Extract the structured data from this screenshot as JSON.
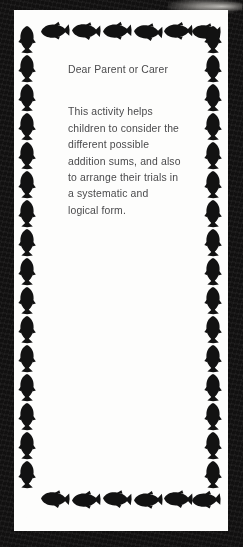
{
  "document": {
    "type": "worksheet-parent-note",
    "page_background": "#111010",
    "card_background": "#fdfdfc",
    "text_color": "#4a4a4c",
    "border_motif": "fish"
  },
  "note": {
    "salutation": "Dear Parent or Carer",
    "body_lines": [
      "This activity helps",
      "children to consider the",
      "different possible",
      "addition sums, and also",
      "to arrange their trials in",
      "a systematic and",
      "logical form."
    ],
    "body_text": "This activity helps children to consider the different possible addition sums, and also to arrange their trials in a systematic and logical form."
  },
  "border": {
    "top_row": {
      "icon": "fish-icon",
      "count": 6,
      "orientation": "horizontal",
      "facing": "left"
    },
    "bottom_row": {
      "icon": "fish-icon",
      "count": 6,
      "orientation": "horizontal",
      "facing": "left"
    },
    "left_column": {
      "icon": "fish-icon",
      "count": 16,
      "orientation": "vertical",
      "facing": "up"
    },
    "right_column": {
      "icon": "fish-icon",
      "count": 16,
      "orientation": "vertical",
      "facing": "up"
    },
    "fish_color": "#121212"
  },
  "artifacts": {
    "scan_smudge": "grey scanner smudge at top-right edge"
  }
}
